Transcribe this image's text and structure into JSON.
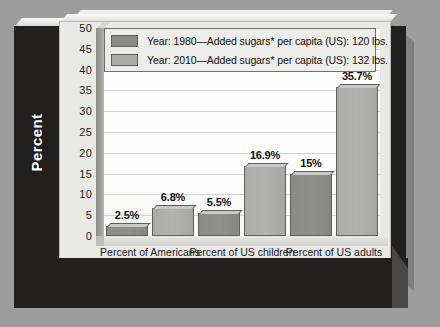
{
  "chart_data": {
    "type": "bar",
    "title": "",
    "xlabel": "",
    "ylabel": "Percent",
    "ylim": [
      0,
      50
    ],
    "yticks": [
      50,
      45,
      40,
      35,
      30,
      25,
      20,
      15,
      10,
      5,
      0
    ],
    "grid": true,
    "legend_position": "top-inside",
    "categories": [
      "Percent of Americans\nwith diabetes",
      "Percent of US children\nwho are obese",
      "Percent of US adults\nwho are obese"
    ],
    "category_lines": [
      [
        "Percent of Americans",
        "with diabetes"
      ],
      [
        "Percent of US children",
        "who are obese"
      ],
      [
        "Percent of US adults",
        "who are obese"
      ]
    ],
    "series": [
      {
        "name": "Year: 1980—Added sugars* per capita (US): 120 lbs.",
        "color": "#8a8a87",
        "values": [
          2.5,
          5.5,
          15
        ],
        "data_labels": [
          "2.5%",
          "5.5%",
          "15%"
        ]
      },
      {
        "name": "Year: 2010—Added sugars* per capita (US): 132 lbs.",
        "color": "#acaca9",
        "values": [
          6.8,
          16.9,
          35.7
        ],
        "data_labels": [
          "6.8%",
          "16.9%",
          "35.7%"
        ]
      }
    ]
  },
  "axis": {
    "y_title": "Percent",
    "tick_labels": [
      "50",
      "45",
      "40",
      "35",
      "30",
      "25",
      "20",
      "15",
      "10",
      "5",
      "0"
    ]
  },
  "legend": {
    "entries": [
      {
        "label": "Year: 1980—Added sugars* per capita (US): 120 lbs.",
        "swatch": "s1980"
      },
      {
        "label": "Year: 2010—Added sugars* per capita (US): 132 lbs.",
        "swatch": "s2010"
      }
    ]
  },
  "colors": {
    "background": "#9d9d9d",
    "panel_dark": "#221f1f",
    "plot_background": "#ffffff",
    "series_1980": "#8a8a87",
    "series_2010": "#acaca9",
    "gridline": "#d3d3d0",
    "text": "#111111",
    "axis_title_text": "#ffffff"
  }
}
